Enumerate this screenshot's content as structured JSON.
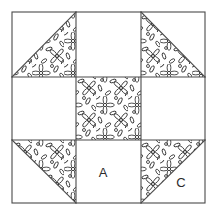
{
  "figure": {
    "name": "quilt-block-diagram",
    "width": 218,
    "height": 214,
    "background_color": "#ffffff",
    "line_color": "#4a4a4a",
    "fabric_print_color": "#3a3a3a",
    "plain_fabric_color": "#ffffff",
    "label_color": "#2b2b2b",
    "border": {
      "left": 12,
      "top": 12,
      "right": 205,
      "bottom": 203
    },
    "grid": {
      "columns": 3,
      "rows": 3,
      "x_lines": [
        12,
        76,
        141,
        205
      ],
      "y_lines": [
        12,
        77,
        140,
        203
      ]
    }
  },
  "labels": [
    {
      "text": "A",
      "x": 103,
      "y": 174,
      "patch": "bottom-center-plain-square"
    },
    {
      "text": "C",
      "x": 181,
      "y": 184,
      "patch": "bottom-right-plain-triangle"
    }
  ],
  "patches": [
    {
      "id": "top-left",
      "row": 0,
      "col": 0,
      "type": "half-square-triangle",
      "diagonal": "bottomleft-to-topright",
      "printed_half": "lower-right",
      "plain_half": "upper-left",
      "label": ""
    },
    {
      "id": "top-center",
      "row": 0,
      "col": 1,
      "type": "plain-square",
      "diagonal": "none",
      "printed_half": "none",
      "plain_half": "all",
      "label": ""
    },
    {
      "id": "top-right",
      "row": 0,
      "col": 2,
      "type": "half-square-triangle",
      "diagonal": "topleft-to-bottomright",
      "printed_half": "lower-left",
      "plain_half": "upper-right",
      "label": ""
    },
    {
      "id": "middle-left",
      "row": 1,
      "col": 0,
      "type": "plain-square",
      "diagonal": "none",
      "printed_half": "none",
      "plain_half": "all",
      "label": ""
    },
    {
      "id": "center",
      "row": 1,
      "col": 1,
      "type": "printed-square",
      "diagonal": "none",
      "printed_half": "all",
      "plain_half": "none",
      "label": ""
    },
    {
      "id": "middle-right",
      "row": 1,
      "col": 2,
      "type": "plain-square",
      "diagonal": "none",
      "printed_half": "none",
      "plain_half": "all",
      "label": ""
    },
    {
      "id": "bottom-left",
      "row": 2,
      "col": 0,
      "type": "half-square-triangle",
      "diagonal": "topleft-to-bottomright",
      "printed_half": "upper-right",
      "plain_half": "lower-left",
      "label": ""
    },
    {
      "id": "bottom-center",
      "row": 2,
      "col": 1,
      "type": "plain-square",
      "diagonal": "none",
      "printed_half": "none",
      "plain_half": "all",
      "label": "A"
    },
    {
      "id": "bottom-right",
      "row": 2,
      "col": 2,
      "type": "half-square-triangle",
      "diagonal": "bottomleft-to-topright",
      "printed_half": "upper-left",
      "plain_half": "lower-right",
      "label": "C"
    }
  ],
  "fabric_print": {
    "name": "four-petal-floral-tossed-print",
    "motif": "four-petal flower with round center and scattered leaf strokes",
    "tile_size": 32
  }
}
